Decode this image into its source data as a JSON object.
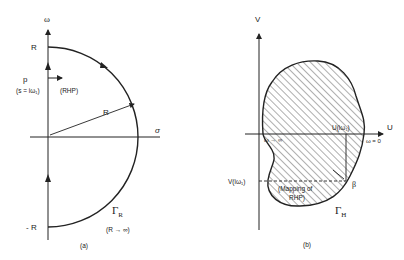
{
  "panel_a": {
    "caption": "(a)",
    "axis_vertical": "ω",
    "axis_horizontal": "σ",
    "label_R_top": "R",
    "label_R_bottom": "- R",
    "label_p": "p",
    "label_s": "(s = iω₁)",
    "label_rhp": "(RHP)",
    "label_radius": "R",
    "contour_symbol": "Γ",
    "contour_subscript": "R",
    "contour_limit": "(R → ∞)"
  },
  "panel_b": {
    "caption": "(b)",
    "axis_vertical": "V",
    "axis_horizontal": "U",
    "label_omega_inf": "ω → ∞",
    "label_omega_zero": "ω = 0",
    "label_u": "U(iω₁)",
    "label_v": "V(iω₁)",
    "label_mapping_1": "(Mapping of",
    "label_mapping_2": "RHP)",
    "label_beta": "β",
    "contour_symbol": "Γ",
    "contour_subscript": "H"
  },
  "colors": {
    "ink": "#222222",
    "background": "#ffffff"
  }
}
